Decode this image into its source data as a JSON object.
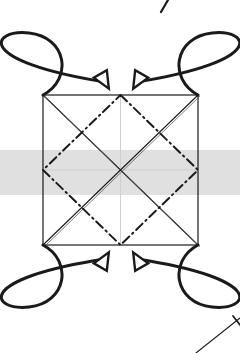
{
  "page": {
    "width": 240,
    "height": 353,
    "background_color": "#ffffff",
    "title": "Scanned geometric diagram with square, inscribed diamond and four corner rotation arrows",
    "caption": ""
  },
  "colors": {
    "ink": "#1a1a1a",
    "ink_light": "#555555",
    "faint_guide": "#cfcfcf",
    "scan_band": "#dedede",
    "paper": "#ffffff",
    "arrow_fill": "#ffffff"
  },
  "scan_band": {
    "label": "scanner-shadow-band",
    "x": 0,
    "y": 150,
    "width": 240,
    "height": 45,
    "color": "#dedede"
  },
  "figure": {
    "name": "square-with-inscribed-diamond-and-rotation-arrows",
    "square": {
      "label": "outer-square",
      "stroke_color": "#1a1a1a",
      "stroke_width": 1.2,
      "left": 43,
      "top": 95,
      "right": 198,
      "bottom": 245,
      "width": 155,
      "height": 150,
      "corners": [
        {
          "name": "top-left",
          "x": 43,
          "y": 95
        },
        {
          "name": "top-right",
          "x": 198,
          "y": 95
        },
        {
          "name": "bottom-right",
          "x": 198,
          "y": 245
        },
        {
          "name": "bottom-left",
          "x": 43,
          "y": 245
        }
      ]
    },
    "diagonals": {
      "label": "square-diagonals",
      "style": "solid-double",
      "stroke_color": "#1a1a1a",
      "stroke_width": 1.1,
      "lines": [
        {
          "name": "diagonal-tl-br",
          "x1": 43,
          "y1": 95,
          "x2": 198,
          "y2": 245
        },
        {
          "name": "diagonal-tr-bl",
          "x1": 198,
          "y1": 95,
          "x2": 43,
          "y2": 245
        }
      ]
    },
    "midlines": {
      "label": "faint-center-guides",
      "stroke_color": "#cfcfcf",
      "stroke_width": 1,
      "lines": [
        {
          "name": "horizontal-midline",
          "x1": 43,
          "y1": 170,
          "x2": 198,
          "y2": 170
        },
        {
          "name": "vertical-midline",
          "x1": 120.5,
          "y1": 95,
          "x2": 120.5,
          "y2": 245
        }
      ]
    },
    "diamond": {
      "label": "inscribed-diamond",
      "style": "dash-dot",
      "stroke_color": "#1a1a1a",
      "stroke_width": 2.0,
      "dash_pattern": "9 4 1.5 4",
      "vertices": [
        {
          "name": "top-midpoint",
          "x": 120.5,
          "y": 95
        },
        {
          "name": "right-midpoint",
          "x": 198,
          "y": 170
        },
        {
          "name": "bottom-midpoint",
          "x": 120.5,
          "y": 245
        },
        {
          "name": "left-midpoint",
          "x": 43,
          "y": 170
        }
      ]
    },
    "arrows": [
      {
        "name": "arrow-top-left",
        "description": "Loop rising from top-left corner, sweeping clockwise over the top and ending with a hollow arrowhead pointing down-right toward top edge centre",
        "direction": "clockwise",
        "start": {
          "x": 43,
          "y": 95
        },
        "end": {
          "x": 105,
          "y": 82
        },
        "head_angle_deg": 60,
        "stroke_color": "#1a1a1a",
        "stroke_width": 3,
        "fill": "#ffffff"
      },
      {
        "name": "arrow-top-right",
        "description": "Loop rising from top-right corner, sweeping counter-clockwise over the top and ending with a hollow arrowhead pointing down-left toward top edge centre",
        "direction": "counter-clockwise",
        "start": {
          "x": 198,
          "y": 95
        },
        "end": {
          "x": 137,
          "y": 82
        },
        "head_angle_deg": 120,
        "stroke_color": "#1a1a1a",
        "stroke_width": 3,
        "fill": "#ffffff"
      },
      {
        "name": "arrow-bottom-left",
        "description": "Loop descending from bottom-left corner, sweeping counter-clockwise below and ending with a hollow arrowhead pointing up-right toward bottom edge centre",
        "direction": "counter-clockwise",
        "start": {
          "x": 43,
          "y": 245
        },
        "end": {
          "x": 105,
          "y": 259
        },
        "head_angle_deg": -60,
        "stroke_color": "#1a1a1a",
        "stroke_width": 3,
        "fill": "#ffffff"
      },
      {
        "name": "arrow-bottom-right",
        "description": "Loop descending from bottom-right corner, sweeping clockwise below and ending with a hollow arrowhead pointing up-left toward bottom edge centre",
        "direction": "clockwise",
        "start": {
          "x": 198,
          "y": 245
        },
        "end": {
          "x": 137,
          "y": 259
        },
        "head_angle_deg": -120,
        "stroke_color": "#1a1a1a",
        "stroke_width": 3,
        "fill": "#ffffff"
      }
    ],
    "stray_marks": [
      {
        "name": "stray-mark-top-right",
        "description": "Short diagonal pen stroke at the very top of the page",
        "x1": 161,
        "y1": 12,
        "x2": 168,
        "y2": 0,
        "stroke_width": 2.2,
        "stroke_color": "#1a1a1a"
      },
      {
        "name": "stray-line-bottom-right",
        "description": "Thin ruled line entering from the bottom-right corner with a short end tick",
        "x1": 196,
        "y1": 353,
        "x2": 240,
        "y2": 318,
        "stroke_width": 1.1,
        "stroke_color": "#1a1a1a",
        "tick": {
          "x1": 233,
          "y1": 316,
          "x2": 240,
          "y2": 325
        }
      }
    ]
  }
}
